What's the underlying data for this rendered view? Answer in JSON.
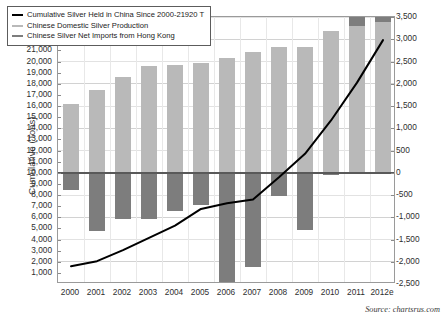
{
  "chart_data": {
    "type": "bar",
    "title": "",
    "xlabel": "",
    "ylabel": "Cumulative (Tons)",
    "ylabel_right": "Annual Production & Net Imports (Tons)",
    "grid": true,
    "legend_position": "top-left",
    "categories": [
      "2000",
      "2001",
      "2002",
      "2003",
      "2004",
      "2005",
      "2006",
      "2007",
      "2008",
      "2009",
      "2010",
      "2011",
      "2012e"
    ],
    "left_axis": {
      "label": "Cumulative (Tons)",
      "min": 0,
      "max": 24000,
      "step": 1000,
      "ticks": [
        "1,000",
        "2,000",
        "3,000",
        "4,000",
        "5,000",
        "6,000",
        "7,000",
        "8,000",
        "9,000",
        "10,000",
        "11,000",
        "12,000",
        "13,000",
        "14,000",
        "15,000",
        "16,000",
        "17,000",
        "18,000",
        "19,000",
        "20,000",
        "21,000",
        "22,000",
        "23,000",
        "24,000"
      ]
    },
    "right_axis": {
      "label": "Annual Production & Net Imports (Tons)",
      "min": -2500,
      "max": 3500,
      "step": 500,
      "ticks": [
        "-2,500",
        "-2,000",
        "-1,500",
        "-1,000",
        "-500",
        "0",
        "500",
        "1,000",
        "1,500",
        "2,000",
        "2,500",
        "3,000",
        "3,500"
      ]
    },
    "series": [
      {
        "name": "Cumulative Silver Held in China Since 2000-21920 T",
        "type": "line",
        "axis": "left",
        "color": "#000000",
        "values": [
          1600,
          2050,
          3050,
          4150,
          5250,
          6750,
          7250,
          7600,
          9600,
          11700,
          14700,
          18100,
          21920
        ]
      },
      {
        "name": "Chinese Domestic Silver Production",
        "type": "bar",
        "axis": "right",
        "color": "#b9b9b9",
        "values": [
          1550,
          1850,
          2150,
          2400,
          2420,
          2460,
          2580,
          2720,
          2830,
          2830,
          3180,
          3300,
          3390
        ]
      },
      {
        "name": "Chinese Silver Net Imports from Hong Kong",
        "type": "bar",
        "axis": "right",
        "color": "#7d7d7d",
        "values": [
          -380,
          -1300,
          -1030,
          -1050,
          -870,
          -720,
          -2460,
          -2110,
          -530,
          -1280,
          -40,
          190,
          250
        ]
      }
    ]
  },
  "legend": {
    "items": [
      {
        "label": "Cumulative Silver Held in China Since 2000-21920 T",
        "swatch": "cum"
      },
      {
        "label": "Chinese Domestic Silver Production",
        "swatch": "prod"
      },
      {
        "label": "Chinese Silver Net Imports from Hong Kong",
        "swatch": "imp"
      }
    ]
  },
  "footer": {
    "source": "Source: chartsrus.com"
  }
}
